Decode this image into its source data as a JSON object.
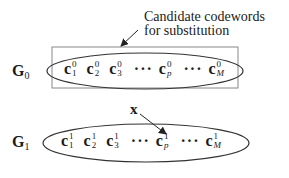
{
  "annotation": {
    "line1": "Candidate codewords",
    "line2": "for substitution"
  },
  "groups": [
    {
      "label": "G",
      "index": "0",
      "codewords": [
        {
          "base": "c",
          "sup": "0",
          "sub": "1"
        },
        {
          "base": "c",
          "sup": "0",
          "sub": "2"
        },
        {
          "base": "c",
          "sup": "0",
          "sub": "3"
        },
        {
          "base": "c",
          "sup": "0",
          "sub": "p"
        },
        {
          "base": "c",
          "sup": "0",
          "sub": "M"
        }
      ]
    },
    {
      "label": "G",
      "index": "1",
      "codewords": [
        {
          "base": "c",
          "sup": "1",
          "sub": "1"
        },
        {
          "base": "c",
          "sup": "1",
          "sub": "2"
        },
        {
          "base": "c",
          "sup": "1",
          "sub": "3"
        },
        {
          "base": "c",
          "sup": "1",
          "sub": "p"
        },
        {
          "base": "c",
          "sup": "1",
          "sub": "M"
        }
      ]
    }
  ],
  "dots": "···",
  "input_vector": "x",
  "colors": {
    "stroke": "#333333",
    "box": "#777777"
  }
}
